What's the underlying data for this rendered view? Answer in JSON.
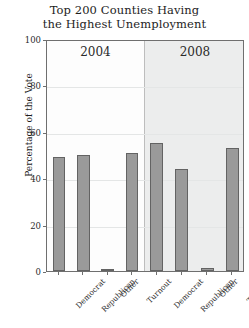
{
  "chart_data": {
    "type": "bar",
    "title": "Top 200 Counties Having the Highest Unemployment",
    "title_line1": "Top 200 Counties Having",
    "title_line2": "the Highest Unemployment",
    "xlabel": "",
    "ylabel": "Percentage of the Vote",
    "ylim": [
      0,
      100
    ],
    "yticks": [
      0,
      20,
      40,
      60,
      80,
      100
    ],
    "ytick_labels": [
      "0",
      "20",
      "40",
      "60",
      "80",
      "100"
    ],
    "grid": true,
    "legend": "none",
    "categories": [
      "Democrat",
      "Republican",
      "Other",
      "Turnout"
    ],
    "panels": [
      {
        "label": "2004",
        "values": [
          49,
          50,
          1,
          51
        ]
      },
      {
        "label": "2008",
        "values": [
          55,
          44,
          1.5,
          53
        ]
      }
    ],
    "series": [
      {
        "name": "2004",
        "values": [
          49,
          50,
          1,
          51
        ]
      },
      {
        "name": "2008",
        "values": [
          55,
          44,
          1.5,
          53
        ]
      }
    ],
    "bar_color": "#9a9a9a",
    "bar_edge_color": "#636363",
    "panel_background_2004": "#fdfdfd",
    "panel_background_2008": "#eceded",
    "axis_color": "#6f6f6f",
    "grid_color": "#e4e6e6"
  }
}
